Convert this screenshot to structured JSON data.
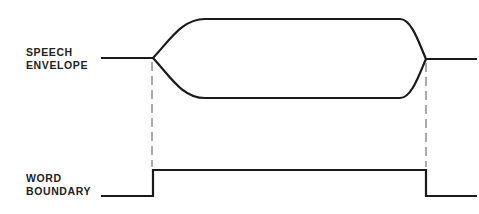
{
  "diagram": {
    "signals": [
      {
        "name": "speech-envelope",
        "label_lines": [
          "SPEECH",
          "ENVELOPE"
        ]
      },
      {
        "name": "word-boundary",
        "label_lines": [
          "WORD",
          "BOUNDARY"
        ]
      }
    ],
    "colors": {
      "stroke": "#1a1a1a",
      "dashed": "#555555",
      "background": "#ffffff"
    }
  }
}
